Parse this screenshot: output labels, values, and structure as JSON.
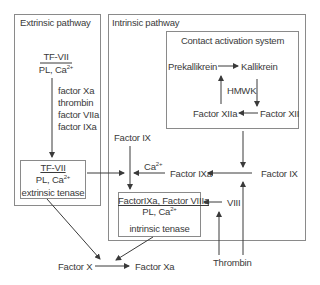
{
  "extrinsic": {
    "title": "Extrinsic pathway",
    "complex_top": "TF-VII",
    "complex_cofactor": "PL, Ca",
    "activators": [
      "factor Xa",
      "thrombin",
      "factor VIIa",
      "factor IXa"
    ],
    "tenase_top": "TF-VII",
    "tenase_cofactor": "PL, Ca",
    "tenase_label": "extrinsic tenase"
  },
  "intrinsic": {
    "title": "Intrinsic pathway",
    "contact": {
      "title": "Contact activation system",
      "prekallikrein": "Prekallikrein",
      "kallikrein": "Kallikrein",
      "hmwk": "HMWK",
      "factor_xiia": "Factor XIIa",
      "factor_xii": "Factor XII"
    },
    "factor_ix_left": "Factor IX",
    "ca_label": "Ca",
    "factor_ixa": "Factor IXa",
    "factor_ix_right": "Factor IX",
    "tenase_top": "FactorIXa, Factor VIIIa",
    "tenase_cofactor": "PL, Ca",
    "tenase_label": "intrinsic tenase",
    "viii": "VIII"
  },
  "bottom": {
    "thrombin": "Thrombin",
    "factor_x": "Factor X",
    "factor_xa": "Factor Xa"
  },
  "superscript": "2+",
  "colors": {
    "line": "#3a3a3a",
    "border": "#8a8a8a",
    "text": "#3a3a3a"
  }
}
